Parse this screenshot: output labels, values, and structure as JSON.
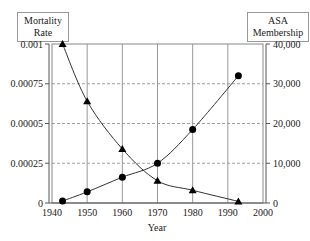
{
  "chart_data": {
    "type": "line",
    "title": "",
    "xlabel": "Year",
    "ylabel_left": "Mortality Rate",
    "ylabel_right": "ASA Membership",
    "x_ticks": [
      "1940",
      "1950",
      "1960",
      "1970",
      "1980",
      "1990",
      "2000"
    ],
    "xlim": [
      1940,
      2000
    ],
    "y_left_ticks": [
      "0",
      "0.00025",
      "0.00005",
      "0.00075",
      "0.001"
    ],
    "y_left_tick_values": [
      0,
      0.00025,
      0.0005,
      0.00075,
      0.001
    ],
    "ylim_left": [
      0,
      0.001
    ],
    "y_right_ticks": [
      "0",
      "10,000",
      "20,000",
      "30,000",
      "40,000"
    ],
    "y_right_tick_values": [
      0,
      10000,
      20000,
      30000,
      40000
    ],
    "ylim_right": [
      0,
      40000
    ],
    "grid": {
      "vertical": true,
      "horizontal_dashed": true
    },
    "series": [
      {
        "name": "Mortality Rate",
        "axis": "left",
        "marker": "triangle",
        "x": [
          1943,
          1950,
          1960,
          1970,
          1980,
          1993
        ],
        "values": [
          0.001,
          0.00064,
          0.00034,
          0.00014,
          8e-05,
          1e-05
        ]
      },
      {
        "name": "ASA Membership",
        "axis": "right",
        "marker": "circle",
        "x": [
          1943,
          1950,
          1960,
          1970,
          1980,
          1993
        ],
        "values": [
          500,
          2800,
          6500,
          10000,
          18500,
          32000
        ]
      }
    ]
  },
  "labels": {
    "left_box_line1": "Mortality",
    "left_box_line2": "Rate",
    "right_box_line1": "ASA",
    "right_box_line2": "Membership",
    "xlabel": "Year"
  }
}
